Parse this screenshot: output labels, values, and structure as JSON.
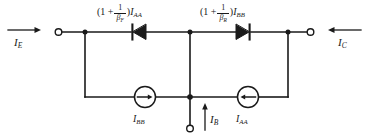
{
  "diagram": {
    "type": "circuit-schematic",
    "stroke_color": "#1a1a1a",
    "background_color": "#ffffff"
  },
  "labels": {
    "forward_branch": {
      "prefix": "(1 +",
      "fraction_numerator": "1",
      "fraction_denominator": "β",
      "fraction_denominator_sub": "F",
      "suffix": ")",
      "current": "I",
      "current_sub": "AA",
      "plain": "(1 + 1/βF) IAA"
    },
    "reverse_branch": {
      "prefix": "(1 +",
      "fraction_numerator": "1",
      "fraction_denominator": "β",
      "fraction_denominator_sub": "R",
      "suffix": ")",
      "current": "I",
      "current_sub": "BB",
      "plain": "(1 + 1/βR) IBB"
    },
    "emitter_current": {
      "symbol": "I",
      "sub": "E",
      "plain": "IE"
    },
    "collector_current": {
      "symbol": "I",
      "sub": "C",
      "plain": "IC"
    },
    "base_current": {
      "symbol": "I",
      "sub": "B",
      "plain": "IB"
    },
    "source_left": {
      "symbol": "I",
      "sub": "BB",
      "plain": "IBB"
    },
    "source_right": {
      "symbol": "I",
      "sub": "AA",
      "plain": "IAA"
    }
  },
  "components": {
    "diode_forward": {
      "name": "diode-forward",
      "direction": "left"
    },
    "diode_reverse": {
      "name": "diode-reverse",
      "direction": "right"
    },
    "current_source_left": {
      "name": "current-source-ibb",
      "arrow": "right"
    },
    "current_source_right": {
      "name": "current-source-iaa",
      "arrow": "left"
    },
    "terminal_emitter": {
      "name": "terminal-emitter"
    },
    "terminal_collector": {
      "name": "terminal-collector"
    },
    "terminal_base": {
      "name": "terminal-base"
    }
  },
  "arrows": {
    "emitter": {
      "direction": "right"
    },
    "collector": {
      "direction": "left"
    },
    "base": {
      "direction": "up"
    }
  }
}
